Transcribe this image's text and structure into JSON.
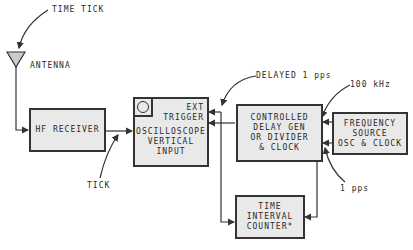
{
  "labels": {
    "time_tick": "TIME TICK",
    "antenna": "ANTENNA",
    "tick": "TICK",
    "delayed_pps": "DELAYED 1 pps",
    "khz": "100 kHz",
    "pps": "1 pps"
  },
  "blocks": {
    "hf_receiver": {
      "lines": [
        "HF RECEIVER"
      ]
    },
    "oscilloscope": {
      "trigger": [
        "EXT",
        "TRIGGER"
      ],
      "lines": [
        "OSCILLOSCOPE",
        "VERTICAL",
        "INPUT"
      ]
    },
    "delay_gen": {
      "lines": [
        "CONTROLLED",
        "DELAY GEN",
        "OR DIVIDER",
        "& CLOCK"
      ]
    },
    "freq_source": {
      "lines": [
        "FREQUENCY",
        "SOURCE",
        "OSC & CLOCK"
      ]
    },
    "interval_counter": {
      "lines": [
        "TIME",
        "INTERVAL",
        "COUNTER*"
      ]
    }
  },
  "colors": {
    "box_fill": "#e9e9e9",
    "stroke": "#333333"
  }
}
